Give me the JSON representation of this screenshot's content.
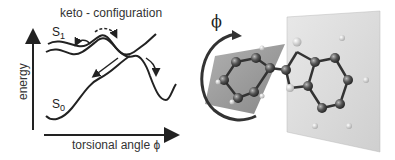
{
  "diagram": {
    "title": "keto - configuration",
    "y_axis_label": "energy",
    "x_axis_label": "torsional angle ϕ",
    "states": [
      {
        "name": "S",
        "sub": "1"
      },
      {
        "name": "S",
        "sub": "0"
      }
    ],
    "rotation_label": "ϕ"
  }
}
